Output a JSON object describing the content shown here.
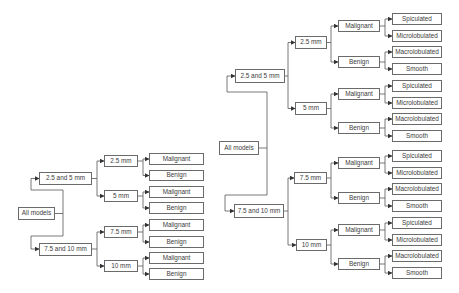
{
  "colors": {
    "border": "#6a6a6a",
    "text": "#3c3c3c",
    "line": "#555555",
    "background": "#ffffff"
  },
  "left_tree": {
    "root": "All models",
    "groups": [
      {
        "label": "2.5 and 5 mm",
        "sizes": [
          {
            "label": "2.5 mm",
            "classes": [
              "Malignant",
              "Benign"
            ]
          },
          {
            "label": "5 mm",
            "classes": [
              "Malignant",
              "Benign"
            ]
          }
        ]
      },
      {
        "label": "7.5 and 10 mm",
        "sizes": [
          {
            "label": "7.5 mm",
            "classes": [
              "Malignant",
              "Benign"
            ]
          },
          {
            "label": "10 mm",
            "classes": [
              "Malignant",
              "Benign"
            ]
          }
        ]
      }
    ]
  },
  "right_tree": {
    "root": "All models",
    "groups": [
      {
        "label": "2.5 and 5 mm",
        "sizes": [
          {
            "label": "2.5 mm",
            "classes": [
              {
                "label": "Malignant",
                "shapes": [
                  "Spiculated",
                  "Microlobulated"
                ]
              },
              {
                "label": "Benign",
                "shapes": [
                  "Macrolobulated",
                  "Smooth"
                ]
              }
            ]
          },
          {
            "label": "5 mm",
            "classes": [
              {
                "label": "Malignant",
                "shapes": [
                  "Spiculated",
                  "Microlobulated"
                ]
              },
              {
                "label": "Benign",
                "shapes": [
                  "Macrolobulated",
                  "Smooth"
                ]
              }
            ]
          }
        ]
      },
      {
        "label": "7.5 and 10 mm",
        "sizes": [
          {
            "label": "7.5 mm",
            "classes": [
              {
                "label": "Malignant",
                "shapes": [
                  "Spiculated",
                  "Microlobulated"
                ]
              },
              {
                "label": "Benign",
                "shapes": [
                  "Macrolobulated",
                  "Smooth"
                ]
              }
            ]
          },
          {
            "label": "10 mm",
            "classes": [
              {
                "label": "Malignant",
                "shapes": [
                  "Spiculated",
                  "Microlobulated"
                ]
              },
              {
                "label": "Benign",
                "shapes": [
                  "Macrolobulated",
                  "Smooth"
                ]
              }
            ]
          }
        ]
      }
    ]
  }
}
